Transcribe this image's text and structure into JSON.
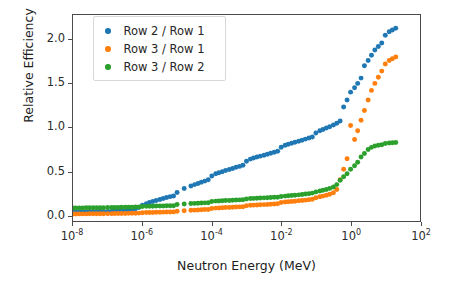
{
  "chart_data": {
    "type": "scatter",
    "title": "",
    "xlabel": "Neutron Energy (MeV)",
    "ylabel": "Relative Efficiency",
    "xscale": "log",
    "yscale": "linear",
    "xlim": [
      1e-08,
      100
    ],
    "ylim": [
      -0.07,
      2.28
    ],
    "grid": false,
    "legend_position": "upper left",
    "xticks": [
      "10⁻⁸",
      "10⁻⁶",
      "10⁻⁴",
      "10⁻²",
      "10⁰",
      "10²"
    ],
    "xtick_values": [
      1e-08,
      1e-06,
      0.0001,
      0.01,
      1,
      100
    ],
    "yticks": [
      "0.0",
      "0.5",
      "1.0",
      "1.5",
      "2.0"
    ],
    "ytick_values": [
      0.0,
      0.5,
      1.0,
      1.5,
      2.0
    ],
    "series": [
      {
        "name": "Row 2 / Row 1",
        "color": "#1f77b4",
        "points": [
          [
            1e-08,
            0.03
          ],
          [
            1.2e-08,
            0.031
          ],
          [
            1.5e-08,
            0.032
          ],
          [
            1.9e-08,
            0.033
          ],
          [
            2.4e-08,
            0.034
          ],
          [
            3e-08,
            0.035
          ],
          [
            3.8e-08,
            0.036
          ],
          [
            4.8e-08,
            0.037
          ],
          [
            6e-08,
            0.038
          ],
          [
            7.6e-08,
            0.039
          ],
          [
            1e-07,
            0.04
          ],
          [
            1.3e-07,
            0.042
          ],
          [
            1.6e-07,
            0.044
          ],
          [
            2e-07,
            0.046
          ],
          [
            2.5e-07,
            0.048
          ],
          [
            3.2e-07,
            0.051
          ],
          [
            4e-07,
            0.055
          ],
          [
            5e-07,
            0.06
          ],
          [
            6.3e-07,
            0.07
          ],
          [
            7.9e-07,
            0.085
          ],
          [
            1e-06,
            0.11
          ],
          [
            1.3e-06,
            0.128
          ],
          [
            1.6e-06,
            0.14
          ],
          [
            2e-06,
            0.152
          ],
          [
            2.5e-06,
            0.163
          ],
          [
            3.2e-06,
            0.175
          ],
          [
            4e-06,
            0.186
          ],
          [
            5e-06,
            0.197
          ],
          [
            6.3e-06,
            0.208
          ],
          [
            7.9e-06,
            0.215
          ],
          [
            1e-05,
            0.255
          ],
          [
            1.6e-05,
            0.3
          ],
          [
            2.5e-05,
            0.33
          ],
          [
            3.2e-05,
            0.345
          ],
          [
            4e-05,
            0.358
          ],
          [
            5e-05,
            0.372
          ],
          [
            6.3e-05,
            0.385
          ],
          [
            7.9e-05,
            0.4
          ],
          [
            0.0001,
            0.443
          ],
          [
            0.00013,
            0.468
          ],
          [
            0.00016,
            0.48
          ],
          [
            0.0002,
            0.492
          ],
          [
            0.00025,
            0.505
          ],
          [
            0.00032,
            0.518
          ],
          [
            0.0004,
            0.53
          ],
          [
            0.0005,
            0.542
          ],
          [
            0.00063,
            0.553
          ],
          [
            0.00079,
            0.565
          ],
          [
            0.001,
            0.612
          ],
          [
            0.0013,
            0.636
          ],
          [
            0.0016,
            0.648
          ],
          [
            0.002,
            0.659
          ],
          [
            0.0025,
            0.67
          ],
          [
            0.0032,
            0.681
          ],
          [
            0.004,
            0.692
          ],
          [
            0.005,
            0.703
          ],
          [
            0.0063,
            0.714
          ],
          [
            0.0079,
            0.725
          ],
          [
            0.01,
            0.772
          ],
          [
            0.013,
            0.795
          ],
          [
            0.016,
            0.806
          ],
          [
            0.02,
            0.817
          ],
          [
            0.025,
            0.828
          ],
          [
            0.032,
            0.84
          ],
          [
            0.04,
            0.852
          ],
          [
            0.05,
            0.864
          ],
          [
            0.063,
            0.876
          ],
          [
            0.079,
            0.888
          ],
          [
            0.1,
            0.935
          ],
          [
            0.13,
            0.96
          ],
          [
            0.16,
            0.975
          ],
          [
            0.2,
            0.99
          ],
          [
            0.25,
            1.005
          ],
          [
            0.32,
            1.025
          ],
          [
            0.4,
            1.045
          ],
          [
            0.5,
            1.07
          ],
          [
            0.63,
            1.23
          ],
          [
            0.79,
            1.31
          ],
          [
            1.0,
            1.4
          ],
          [
            1.3,
            1.45
          ],
          [
            1.6,
            1.5
          ],
          [
            2.0,
            1.56
          ],
          [
            2.5,
            1.7
          ],
          [
            3.2,
            1.76
          ],
          [
            4.0,
            1.82
          ],
          [
            5.0,
            1.88
          ],
          [
            6.3,
            1.92
          ],
          [
            7.9,
            1.96
          ],
          [
            10.0,
            2.05
          ],
          [
            13.0,
            2.09
          ],
          [
            16.0,
            2.11
          ],
          [
            20.0,
            2.13
          ]
        ]
      },
      {
        "name": "Row 3 / Row 1",
        "color": "#ff7f0e",
        "points": [
          [
            1e-08,
            0.01
          ],
          [
            1.2e-08,
            0.01
          ],
          [
            1.5e-08,
            0.011
          ],
          [
            1.9e-08,
            0.011
          ],
          [
            2.4e-08,
            0.011
          ],
          [
            3e-08,
            0.012
          ],
          [
            3.8e-08,
            0.012
          ],
          [
            4.8e-08,
            0.012
          ],
          [
            6e-08,
            0.013
          ],
          [
            7.6e-08,
            0.013
          ],
          [
            1e-07,
            0.014
          ],
          [
            1.3e-07,
            0.014
          ],
          [
            1.6e-07,
            0.015
          ],
          [
            2e-07,
            0.015
          ],
          [
            2.5e-07,
            0.016
          ],
          [
            3.2e-07,
            0.016
          ],
          [
            4e-07,
            0.017
          ],
          [
            5e-07,
            0.018
          ],
          [
            6.3e-07,
            0.019
          ],
          [
            7.9e-07,
            0.02
          ],
          [
            1e-06,
            0.024
          ],
          [
            1.3e-06,
            0.026
          ],
          [
            1.6e-06,
            0.027
          ],
          [
            2e-06,
            0.028
          ],
          [
            2.5e-06,
            0.029
          ],
          [
            3.2e-06,
            0.03
          ],
          [
            4e-06,
            0.031
          ],
          [
            5e-06,
            0.032
          ],
          [
            6.3e-06,
            0.033
          ],
          [
            7.9e-06,
            0.034
          ],
          [
            1e-05,
            0.042
          ],
          [
            1.6e-05,
            0.048
          ],
          [
            2.5e-05,
            0.052
          ],
          [
            3.2e-05,
            0.054
          ],
          [
            4e-05,
            0.056
          ],
          [
            5e-05,
            0.058
          ],
          [
            6.3e-05,
            0.06
          ],
          [
            7.9e-05,
            0.062
          ],
          [
            0.0001,
            0.072
          ],
          [
            0.00013,
            0.077
          ],
          [
            0.00016,
            0.079
          ],
          [
            0.0002,
            0.081
          ],
          [
            0.00025,
            0.083
          ],
          [
            0.00032,
            0.085
          ],
          [
            0.0004,
            0.087
          ],
          [
            0.0005,
            0.089
          ],
          [
            0.00063,
            0.091
          ],
          [
            0.00079,
            0.093
          ],
          [
            0.001,
            0.104
          ],
          [
            0.0013,
            0.109
          ],
          [
            0.0016,
            0.111
          ],
          [
            0.002,
            0.113
          ],
          [
            0.0025,
            0.115
          ],
          [
            0.0032,
            0.117
          ],
          [
            0.004,
            0.119
          ],
          [
            0.005,
            0.122
          ],
          [
            0.0063,
            0.124
          ],
          [
            0.0079,
            0.127
          ],
          [
            0.01,
            0.14
          ],
          [
            0.013,
            0.146
          ],
          [
            0.016,
            0.149
          ],
          [
            0.02,
            0.152
          ],
          [
            0.025,
            0.156
          ],
          [
            0.032,
            0.16
          ],
          [
            0.04,
            0.164
          ],
          [
            0.05,
            0.168
          ],
          [
            0.063,
            0.173
          ],
          [
            0.079,
            0.178
          ],
          [
            0.1,
            0.196
          ],
          [
            0.13,
            0.206
          ],
          [
            0.16,
            0.214
          ],
          [
            0.2,
            0.224
          ],
          [
            0.25,
            0.236
          ],
          [
            0.32,
            0.252
          ],
          [
            0.4,
            0.29
          ],
          [
            0.5,
            0.4
          ],
          [
            0.63,
            0.52
          ],
          [
            0.79,
            0.64
          ],
          [
            1.0,
            1.02
          ],
          [
            1.3,
            0.86
          ],
          [
            1.6,
            0.96
          ],
          [
            2.0,
            1.08
          ],
          [
            2.5,
            1.19
          ],
          [
            3.2,
            1.31
          ],
          [
            4.0,
            1.42
          ],
          [
            5.0,
            1.5
          ],
          [
            6.3,
            1.57
          ],
          [
            7.9,
            1.64
          ],
          [
            10.0,
            1.72
          ],
          [
            13.0,
            1.76
          ],
          [
            16.0,
            1.78
          ],
          [
            20.0,
            1.8
          ]
        ]
      },
      {
        "name": "Row 3 / Row 2",
        "color": "#2ca02c",
        "points": [
          [
            1e-08,
            0.078
          ],
          [
            1.2e-08,
            0.078
          ],
          [
            1.5e-08,
            0.079
          ],
          [
            1.9e-08,
            0.079
          ],
          [
            2.4e-08,
            0.08
          ],
          [
            3e-08,
            0.08
          ],
          [
            3.8e-08,
            0.081
          ],
          [
            4.8e-08,
            0.081
          ],
          [
            6e-08,
            0.082
          ],
          [
            7.6e-08,
            0.082
          ],
          [
            1e-07,
            0.083
          ],
          [
            1.3e-07,
            0.084
          ],
          [
            1.6e-07,
            0.084
          ],
          [
            2e-07,
            0.085
          ],
          [
            2.5e-07,
            0.086
          ],
          [
            3.2e-07,
            0.086
          ],
          [
            4e-07,
            0.087
          ],
          [
            5e-07,
            0.088
          ],
          [
            6.3e-07,
            0.089
          ],
          [
            7.9e-07,
            0.09
          ],
          [
            1e-06,
            0.095
          ],
          [
            1.3e-06,
            0.097
          ],
          [
            1.6e-06,
            0.098
          ],
          [
            2e-06,
            0.099
          ],
          [
            2.5e-06,
            0.1
          ],
          [
            3.2e-06,
            0.101
          ],
          [
            4e-06,
            0.102
          ],
          [
            5e-06,
            0.103
          ],
          [
            6.3e-06,
            0.104
          ],
          [
            7.9e-06,
            0.105
          ],
          [
            1e-05,
            0.118
          ],
          [
            1.6e-05,
            0.125
          ],
          [
            2.5e-05,
            0.129
          ],
          [
            3.2e-05,
            0.131
          ],
          [
            4e-05,
            0.133
          ],
          [
            5e-05,
            0.135
          ],
          [
            6.3e-05,
            0.137
          ],
          [
            7.9e-05,
            0.139
          ],
          [
            0.0001,
            0.152
          ],
          [
            0.00013,
            0.157
          ],
          [
            0.00016,
            0.159
          ],
          [
            0.0002,
            0.161
          ],
          [
            0.00025,
            0.163
          ],
          [
            0.00032,
            0.165
          ],
          [
            0.0004,
            0.167
          ],
          [
            0.0005,
            0.169
          ],
          [
            0.00063,
            0.171
          ],
          [
            0.00079,
            0.173
          ],
          [
            0.001,
            0.182
          ],
          [
            0.0013,
            0.186
          ],
          [
            0.0016,
            0.188
          ],
          [
            0.002,
            0.19
          ],
          [
            0.0025,
            0.192
          ],
          [
            0.0032,
            0.194
          ],
          [
            0.004,
            0.196
          ],
          [
            0.005,
            0.198
          ],
          [
            0.0063,
            0.2
          ],
          [
            0.0079,
            0.202
          ],
          [
            0.01,
            0.21
          ],
          [
            0.013,
            0.214
          ],
          [
            0.016,
            0.217
          ],
          [
            0.02,
            0.22
          ],
          [
            0.025,
            0.224
          ],
          [
            0.032,
            0.228
          ],
          [
            0.04,
            0.232
          ],
          [
            0.05,
            0.237
          ],
          [
            0.063,
            0.242
          ],
          [
            0.079,
            0.248
          ],
          [
            0.1,
            0.262
          ],
          [
            0.13,
            0.272
          ],
          [
            0.16,
            0.28
          ],
          [
            0.2,
            0.29
          ],
          [
            0.25,
            0.302
          ],
          [
            0.32,
            0.318
          ],
          [
            0.4,
            0.345
          ],
          [
            0.5,
            0.395
          ],
          [
            0.63,
            0.435
          ],
          [
            0.79,
            0.47
          ],
          [
            1.0,
            0.52
          ],
          [
            1.3,
            0.56
          ],
          [
            1.6,
            0.6
          ],
          [
            2.0,
            0.66
          ],
          [
            2.5,
            0.7
          ],
          [
            3.2,
            0.745
          ],
          [
            4.0,
            0.77
          ],
          [
            5.0,
            0.785
          ],
          [
            6.3,
            0.795
          ],
          [
            7.9,
            0.8
          ],
          [
            10.0,
            0.815
          ],
          [
            13.0,
            0.82
          ],
          [
            16.0,
            0.822
          ],
          [
            20.0,
            0.825
          ]
        ]
      }
    ]
  },
  "axes": {
    "xlabel": "Neutron Energy (MeV)",
    "ylabel": "Relative Efficiency"
  },
  "legend": {
    "entries": [
      {
        "label": "Row 2 / Row 1",
        "color": "#1f77b4"
      },
      {
        "label": "Row 3 / Row 1",
        "color": "#ff7f0e"
      },
      {
        "label": "Row 3 / Row 2",
        "color": "#2ca02c"
      }
    ]
  }
}
